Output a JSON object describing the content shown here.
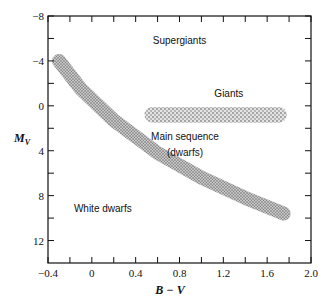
{
  "chart_data": {
    "type": "scatter",
    "title": "",
    "xlabel": "B − V",
    "ylabel": "M_V",
    "xlim": [
      -0.4,
      2.0
    ],
    "ylim": [
      -8,
      14
    ],
    "y_inverted": true,
    "grid": false,
    "x_ticks": [
      "−0.4",
      "0",
      "0.4",
      "0.8",
      "1.2",
      "1.6",
      "2.0"
    ],
    "x_tick_values": [
      -0.4,
      0,
      0.4,
      0.8,
      1.2,
      1.6,
      2.0
    ],
    "x_minor_ticks": [
      -0.2,
      0.2,
      0.6,
      1.0,
      1.4,
      1.8
    ],
    "y_ticks": [
      "−8",
      "−4",
      "0",
      "4",
      "8",
      "12"
    ],
    "y_tick_values": [
      -8,
      -4,
      0,
      4,
      8,
      12
    ],
    "y_minor_ticks": [
      -6,
      -2,
      2,
      6,
      10
    ],
    "regions": [
      {
        "name": "Main sequence",
        "label": "Main sequence",
        "label2": "(dwarfs)",
        "shape": "band",
        "path": [
          [
            -0.3,
            -4.0
          ],
          [
            -0.1,
            -1.5
          ],
          [
            0.2,
            1.3
          ],
          [
            0.6,
            4.2
          ],
          [
            1.0,
            6.4
          ],
          [
            1.4,
            8.2
          ],
          [
            1.75,
            9.6
          ]
        ],
        "fill": "#9a9a9a"
      },
      {
        "name": "Giants",
        "label": "Giants",
        "shape": "band",
        "x_range": [
          0.48,
          1.78
        ],
        "y_center": 0.8,
        "height": 1.4,
        "fill": "#a8a8a8"
      }
    ],
    "annotations": [
      {
        "text": "Supergiants",
        "x": 0.8,
        "y": -5.5
      },
      {
        "text": "Giants",
        "x": 1.25,
        "y": -0.8
      },
      {
        "text": "Main sequence",
        "x": 0.85,
        "y": 3.0
      },
      {
        "text": "(dwarfs)",
        "x": 0.85,
        "y": 4.5
      },
      {
        "text": "White dwarfs",
        "x": 0.1,
        "y": 9.5
      }
    ]
  },
  "labels": {
    "ylabel_main": "M",
    "ylabel_sub": "V",
    "xlabel": "B − V",
    "supergiants": "Supergiants",
    "giants": "Giants",
    "main_sequence": "Main sequence",
    "dwarfs": "(dwarfs)",
    "white_dwarfs": "White dwarfs"
  }
}
